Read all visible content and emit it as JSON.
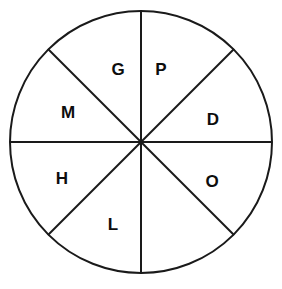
{
  "diagram": {
    "type": "sector-wheel",
    "background_color": "#ffffff",
    "stroke_color": "#1a1a1a",
    "label_color": "#0d0d0d",
    "circle": {
      "center_x": 141,
      "center_y": 142,
      "radius": 131,
      "stroke_width": 2
    },
    "sector_count": 8,
    "divider_count": 4,
    "dividers": [
      {
        "name": "vertical-diameter",
        "angle_deg": 90,
        "x1": 141,
        "y1": 11,
        "x2": 141,
        "y2": 273
      },
      {
        "name": "horizontal-diameter",
        "angle_deg": 0,
        "x1": 10,
        "y1": 142,
        "x2": 272,
        "y2": 142
      },
      {
        "name": "diagonal-diameter-nwse",
        "angle_deg": 135,
        "x1": 48,
        "y1": 49,
        "x2": 234,
        "y2": 235
      },
      {
        "name": "diagonal-diameter-nesw",
        "angle_deg": 45,
        "x1": 234,
        "y1": 49,
        "x2": 48,
        "y2": 235
      }
    ],
    "sectors": [
      {
        "id": "sector-g",
        "label": "G",
        "position": "top-left",
        "start_deg": 90,
        "end_deg": 135,
        "label_x": 118,
        "label_y": 69
      },
      {
        "id": "sector-p",
        "label": "P",
        "position": "top-right",
        "start_deg": 45,
        "end_deg": 90,
        "label_x": 161,
        "label_y": 69
      },
      {
        "id": "sector-d",
        "label": "D",
        "position": "right-upper",
        "start_deg": 0,
        "end_deg": 45,
        "label_x": 213,
        "label_y": 119
      },
      {
        "id": "sector-o",
        "label": "O",
        "position": "right-lower",
        "start_deg": 315,
        "end_deg": 360,
        "label_x": 212,
        "label_y": 181
      },
      {
        "id": "sector-l",
        "label": "L",
        "position": "bottom-left",
        "start_deg": 225,
        "end_deg": 270,
        "label_x": 113,
        "label_y": 224
      },
      {
        "id": "sector-h",
        "label": "H",
        "position": "left-lower",
        "start_deg": 180,
        "end_deg": 225,
        "label_x": 62,
        "label_y": 178
      },
      {
        "id": "sector-m",
        "label": "M",
        "position": "left-upper",
        "start_deg": 135,
        "end_deg": 180,
        "label_x": 68,
        "label_y": 112
      }
    ],
    "labels_clockwise_from_top": [
      "P",
      "D",
      "O",
      "L",
      "H",
      "M",
      "G"
    ]
  }
}
